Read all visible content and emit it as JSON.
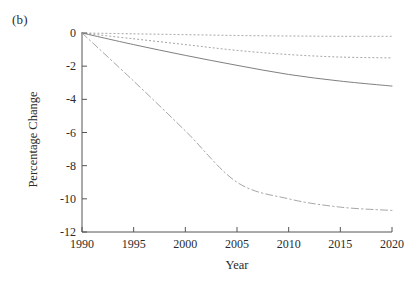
{
  "figure": {
    "panel_label": "(b)"
  },
  "chart_data": {
    "type": "line",
    "title": "",
    "panel": "(b)",
    "xlabel": "Year",
    "ylabel": "Percentage Change",
    "xlim": [
      1990,
      2020
    ],
    "ylim": [
      -12,
      0
    ],
    "xticks": [
      1990,
      1995,
      2000,
      2005,
      2010,
      2015,
      2020
    ],
    "xtick_labels": [
      "1990",
      "1995",
      "2000",
      "2005",
      "2010",
      "2015",
      "2020"
    ],
    "yticks": [
      0,
      -2,
      -4,
      -6,
      -8,
      -10,
      -12
    ],
    "ytick_labels": [
      "0",
      "-2",
      "-4",
      "-6",
      "-8",
      "-10",
      "-12"
    ],
    "grid": false,
    "legend": "none",
    "x": [
      1990,
      1995,
      2000,
      2005,
      2010,
      2015,
      2020
    ],
    "series": [
      {
        "name": "series-1",
        "style": "dotted",
        "color": "#8a8a8a",
        "values": [
          0.0,
          -0.05,
          -0.1,
          -0.15,
          -0.18,
          -0.2,
          -0.2
        ]
      },
      {
        "name": "series-2",
        "style": "dotted",
        "color": "#8a8a8a",
        "values": [
          0.0,
          -0.35,
          -0.7,
          -1.05,
          -1.3,
          -1.45,
          -1.5
        ]
      },
      {
        "name": "series-3",
        "style": "solid",
        "color": "#707070",
        "values": [
          0.0,
          -0.7,
          -1.35,
          -1.95,
          -2.5,
          -2.9,
          -3.2
        ]
      },
      {
        "name": "series-4",
        "style": "dashdot",
        "color": "#9a9a9a",
        "values": [
          0.0,
          -2.9,
          -5.9,
          -9.0,
          -10.0,
          -10.5,
          -10.7
        ]
      }
    ]
  }
}
